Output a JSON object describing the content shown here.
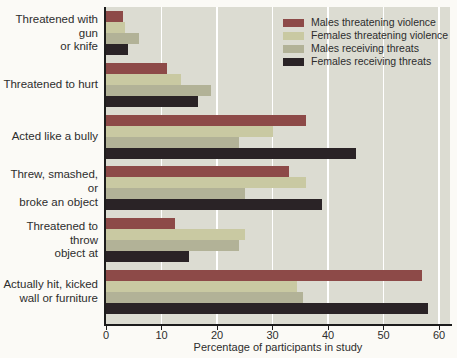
{
  "chart_data": {
    "type": "bar",
    "orientation": "horizontal",
    "xlabel": "Percentage of participants in study",
    "xlim": [
      0,
      60
    ],
    "x_ticks": [
      0,
      10,
      20,
      30,
      40,
      50,
      60
    ],
    "grid": true,
    "legend_position": "top-right-inside",
    "plot_background": "#dcdcd2",
    "gridline_color": "#ffffff",
    "axis_color": "#1c1c1c",
    "categories": [
      "Threatened with gun\nor knife",
      "Threatened to hurt",
      "Acted like a bully",
      "Threw, smashed, or\nbroke an object",
      "Threatened to throw\nobject at",
      "Actually hit, kicked\nwall or furniture"
    ],
    "series": [
      {
        "name": "Males threatening violence",
        "color": "#8d4a48",
        "values": [
          3,
          11,
          36,
          33,
          12.5,
          57
        ]
      },
      {
        "name": "Females threatening violence",
        "color": "#c9c9a2",
        "values": [
          3.5,
          13.5,
          30,
          36,
          25,
          34.5
        ]
      },
      {
        "name": "Males receiving threats",
        "color": "#b2b297",
        "values": [
          6,
          19,
          24,
          25,
          24,
          35.5
        ]
      },
      {
        "name": "Females receiving threats",
        "color": "#2a2326",
        "values": [
          4,
          16.5,
          45,
          39,
          15,
          58
        ]
      }
    ]
  }
}
